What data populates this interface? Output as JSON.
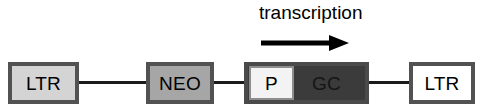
{
  "figure": {
    "canvas": {
      "width": 483,
      "height": 111,
      "background": "#ffffff"
    },
    "annotation": {
      "label": "transcription",
      "arrow_icon": "right-arrow-icon",
      "arrow_direction": "right",
      "arrow_color": "#000000"
    },
    "backbone": {
      "color": "#1a1a1a"
    },
    "elements": [
      {
        "id": "ltr-left",
        "label": "LTR",
        "fill": "#d4d4d4",
        "border": "#525252",
        "x": 8,
        "y": 62,
        "width": 71,
        "height": 42
      },
      {
        "id": "neo",
        "label": "NEO",
        "fill": "#a6a6a6",
        "border": "#525252",
        "x": 146,
        "y": 62,
        "width": 68,
        "height": 42
      },
      {
        "id": "cassette",
        "label": "GC",
        "sub_label": "P",
        "fill": "#3b3b3b",
        "sub_fill": "#f3f3f3",
        "border": "#4a4a4a",
        "x": 244,
        "y": 62,
        "width": 125,
        "height": 42
      },
      {
        "id": "ltr-right",
        "label": "LTR",
        "fill": "#ffffff",
        "border": "#525252",
        "x": 409,
        "y": 62,
        "width": 66,
        "height": 42
      }
    ]
  }
}
